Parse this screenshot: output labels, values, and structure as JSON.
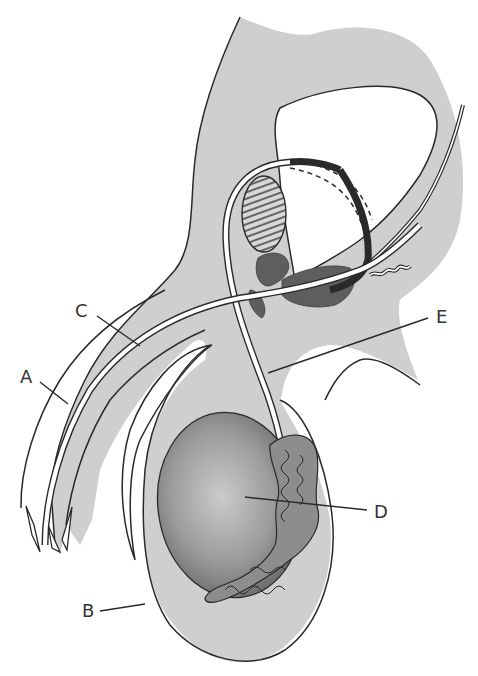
{
  "diagram": {
    "type": "anatomical-illustration",
    "colors": {
      "tissue_fill": "#cfcfcf",
      "outline": "#2a2a2a",
      "gland_fill": "#5e5e5e",
      "testis_center": "#c9c9c9",
      "testis_edge": "#6a6a6a",
      "epididymis_fill": "#8a8a8a",
      "duct_fill": "#ffffff",
      "label_color": "#333333"
    },
    "labels": [
      {
        "id": "A",
        "text": "A",
        "x": 20,
        "y": 345,
        "leader_to": [
          68,
          372
        ]
      },
      {
        "id": "B",
        "text": "B",
        "x": 82,
        "y": 578,
        "leader_to": [
          145,
          568
        ]
      },
      {
        "id": "C",
        "text": "C",
        "x": 75,
        "y": 305,
        "leader_to": [
          140,
          345
        ]
      },
      {
        "id": "D",
        "text": "D",
        "x": 374,
        "y": 506,
        "leader_to": [
          245,
          497
        ]
      },
      {
        "id": "E",
        "text": "E",
        "x": 436,
        "y": 312,
        "leader_to": [
          268,
          373
        ]
      }
    ]
  }
}
